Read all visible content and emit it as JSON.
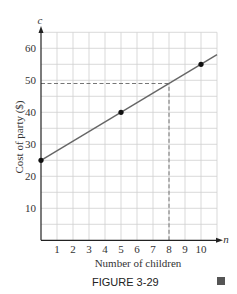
{
  "chart_data": {
    "type": "line",
    "title": "",
    "caption": "FIGURE 3-29",
    "xlabel": "Number of children",
    "ylabel": "Cost of party ($)",
    "x_axis_variable": "n",
    "y_axis_variable": "c",
    "xlim": [
      0,
      11
    ],
    "ylim": [
      0,
      65
    ],
    "x_ticks": [
      1,
      2,
      3,
      4,
      5,
      6,
      7,
      8,
      9,
      10
    ],
    "y_ticks": [
      10,
      20,
      30,
      40,
      50,
      60
    ],
    "grid": true,
    "grid_x_step": 1,
    "grid_y_step": 5,
    "series": [
      {
        "name": "c = 25 + 3n",
        "x": [
          0,
          11
        ],
        "y": [
          25,
          58
        ],
        "color": "#666666"
      }
    ],
    "points": [
      {
        "x": 0,
        "y": 25
      },
      {
        "x": 5,
        "y": 40
      },
      {
        "x": 10,
        "y": 55
      }
    ],
    "reference_lines": [
      {
        "type": "horizontal",
        "y": 49,
        "x_from": 0,
        "x_to": 8,
        "style": "dashed"
      },
      {
        "type": "vertical",
        "x": 8,
        "y_from": 0,
        "y_to": 49,
        "style": "dashed"
      }
    ],
    "end_marker_color": "#555555"
  }
}
